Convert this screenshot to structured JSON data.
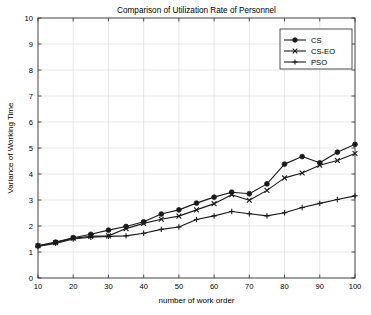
{
  "chart_data": {
    "type": "line",
    "title": "Comparison of Utilization Rate of Personnel",
    "xlabel": "number of work order",
    "ylabel": "Variance of Working Time",
    "xlim": [
      10,
      100
    ],
    "ylim": [
      0,
      10
    ],
    "xticks": [
      10,
      20,
      30,
      40,
      50,
      60,
      70,
      80,
      90,
      100
    ],
    "yticks": [
      0,
      1,
      2,
      3,
      4,
      5,
      6,
      7,
      8,
      9,
      10
    ],
    "grid": true,
    "legend_position": "upper right",
    "x": [
      10,
      15,
      20,
      25,
      30,
      35,
      40,
      45,
      50,
      55,
      60,
      65,
      70,
      75,
      80,
      85,
      90,
      95,
      100
    ],
    "series": [
      {
        "name": "CS",
        "marker": "circle",
        "color": "#1a1a1a",
        "values": [
          1.24,
          1.38,
          1.55,
          1.68,
          1.84,
          1.98,
          2.16,
          2.46,
          2.62,
          2.88,
          3.11,
          3.3,
          3.24,
          3.62,
          4.38,
          4.67,
          4.43,
          4.84,
          5.14
        ]
      },
      {
        "name": "CS-EO",
        "marker": "x",
        "color": "#1a1a1a",
        "values": [
          1.24,
          1.36,
          1.53,
          1.6,
          1.62,
          1.9,
          2.1,
          2.26,
          2.38,
          2.62,
          2.86,
          3.2,
          2.99,
          3.37,
          3.85,
          4.04,
          4.34,
          4.52,
          4.79
        ]
      },
      {
        "name": "PSO",
        "marker": "plus",
        "color": "#1a1a1a",
        "values": [
          1.21,
          1.33,
          1.5,
          1.57,
          1.6,
          1.62,
          1.72,
          1.87,
          1.96,
          2.25,
          2.39,
          2.56,
          2.47,
          2.39,
          2.51,
          2.71,
          2.87,
          3.02,
          3.16
        ]
      }
    ]
  },
  "legend": {
    "entries": [
      {
        "label": "CS"
      },
      {
        "label": "CS-EO"
      },
      {
        "label": "PSO"
      }
    ]
  },
  "colors": {
    "axis": "#262626",
    "grid": "#d9d9d9",
    "line": "#1a1a1a",
    "background": "#ffffff"
  }
}
